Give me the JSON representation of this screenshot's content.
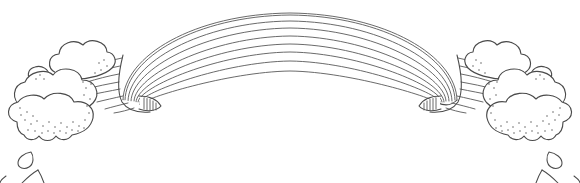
{
  "artwork": {
    "title": "Rainbow Arc With Clouds Coloring Page",
    "style": "black-and-white line art outline drawing",
    "subject": "rainbow arch emerging from two stippled cloud banks with falling raindrops",
    "background_color": "#ffffff",
    "ink_color": "#4a4a4a",
    "canvas": {
      "width": 580,
      "height": 183
    }
  },
  "rainbow": {
    "label": "rainbow arc",
    "band_count": 8,
    "stripe_line_count": 9,
    "uncolored": true,
    "arc_apex": {
      "x": 290,
      "y": 13
    },
    "left_end": {
      "x": 123,
      "y": 100
    },
    "right_end": {
      "x": 457,
      "y": 100
    },
    "left_fold_label": "left folded band end",
    "right_fold_label": "right folded band end",
    "hatch_marks_per_fold": 5
  },
  "left_cloud": {
    "label": "left cloud bank",
    "puff_count": 3,
    "stippled": true,
    "center": {
      "x": 78,
      "y": 96
    }
  },
  "right_cloud": {
    "label": "right cloud bank",
    "puff_count": 3,
    "stippled": true,
    "center": {
      "x": 504,
      "y": 96
    }
  },
  "raindrops": {
    "label": "falling raindrops",
    "left_count": 3,
    "right_count": 3
  }
}
